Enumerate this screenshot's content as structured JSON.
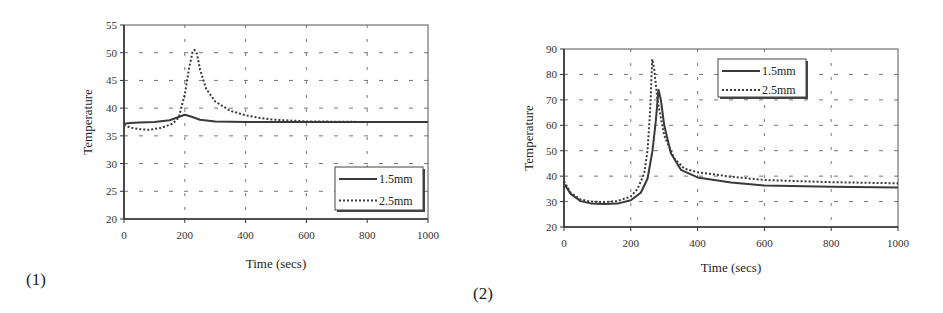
{
  "panel_labels": [
    "(1)",
    "(2)"
  ],
  "chart_data": [
    {
      "type": "line",
      "panel": "(1)",
      "title": "",
      "xlabel": "Time (secs)",
      "ylabel": "Temperature",
      "xlim": [
        0,
        1000
      ],
      "ylim": [
        20,
        55
      ],
      "xticks": [
        0,
        200,
        400,
        600,
        800,
        1000
      ],
      "yticks": [
        20,
        25,
        30,
        35,
        40,
        45,
        50,
        55
      ],
      "grid": true,
      "legend_position": "bottom-right",
      "series": [
        {
          "name": "1.5mm",
          "style": "solid",
          "x": [
            0,
            20,
            50,
            100,
            150,
            180,
            200,
            220,
            250,
            300,
            400,
            500,
            600,
            800,
            1000
          ],
          "y": [
            37.2,
            37.3,
            37.4,
            37.5,
            37.8,
            38.4,
            38.8,
            38.5,
            37.9,
            37.6,
            37.5,
            37.5,
            37.5,
            37.5,
            37.5
          ]
        },
        {
          "name": "2.5mm",
          "style": "dotted",
          "x": [
            0,
            20,
            50,
            80,
            120,
            160,
            180,
            200,
            215,
            225,
            232,
            240,
            250,
            270,
            300,
            350,
            400,
            450,
            500,
            600,
            800,
            1000
          ],
          "y": [
            37.0,
            36.5,
            36.2,
            36.1,
            36.4,
            37.2,
            38.3,
            42.5,
            47.5,
            50.0,
            50.5,
            49.8,
            47.0,
            43.5,
            41.2,
            39.5,
            38.7,
            38.2,
            37.9,
            37.6,
            37.5,
            37.5
          ]
        }
      ]
    },
    {
      "type": "line",
      "panel": "(2)",
      "title": "",
      "xlabel": "Time (secs)",
      "ylabel": "Temperature",
      "xlim": [
        0,
        1000
      ],
      "ylim": [
        20,
        90
      ],
      "xticks": [
        0,
        200,
        400,
        600,
        800,
        1000
      ],
      "yticks": [
        20,
        30,
        40,
        50,
        60,
        70,
        80,
        90
      ],
      "grid": true,
      "legend_position": "top-right",
      "series": [
        {
          "name": "1.5mm",
          "style": "solid",
          "x": [
            0,
            20,
            50,
            80,
            120,
            160,
            200,
            230,
            250,
            265,
            275,
            283,
            290,
            300,
            320,
            350,
            400,
            500,
            600,
            800,
            1000
          ],
          "y": [
            37,
            33,
            30.2,
            29.3,
            29.0,
            29.2,
            30.5,
            33.5,
            39,
            50,
            62,
            74,
            70,
            60,
            49,
            42.5,
            39.5,
            37.5,
            36.3,
            35.8,
            35.5
          ]
        },
        {
          "name": "2.5mm",
          "style": "dotted",
          "x": [
            0,
            20,
            50,
            80,
            120,
            160,
            200,
            220,
            240,
            250,
            258,
            264,
            270,
            280,
            300,
            330,
            360,
            400,
            500,
            600,
            800,
            1000
          ],
          "y": [
            38,
            33.5,
            30.8,
            30.0,
            29.8,
            30.2,
            32.0,
            35,
            41,
            50,
            66,
            86,
            82,
            70,
            56,
            47,
            43,
            41.5,
            39.8,
            38.5,
            37.6,
            37.2
          ]
        }
      ]
    }
  ]
}
